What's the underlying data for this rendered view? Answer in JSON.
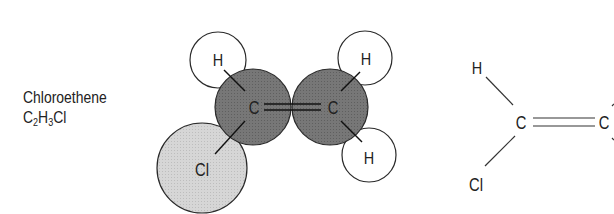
{
  "compound": {
    "name": "Chloroethene",
    "formula_parts": [
      {
        "text": "C",
        "sub": "2"
      },
      {
        "text": "H",
        "sub": "3"
      },
      {
        "text": "Cl",
        "sub": ""
      }
    ]
  },
  "space_filling_model": {
    "atoms": [
      {
        "id": "H1",
        "label": "H",
        "cx": 218,
        "cy": 60,
        "r": 28,
        "fill": "#ffffff"
      },
      {
        "id": "H2",
        "label": "H",
        "cx": 365,
        "cy": 58,
        "r": 27,
        "fill": "#ffffff"
      },
      {
        "id": "H3",
        "label": "H",
        "cx": 369,
        "cy": 155,
        "r": 27,
        "fill": "#ffffff"
      },
      {
        "id": "Cl",
        "label": "Cl",
        "cx": 202,
        "cy": 168,
        "r": 45,
        "fill": "#d4d4d4"
      },
      {
        "id": "C1",
        "label": "C",
        "cx": 253,
        "cy": 107,
        "r": 38,
        "fill": "#7a7a7a"
      },
      {
        "id": "C2",
        "label": "C",
        "cx": 330,
        "cy": 107,
        "r": 38,
        "fill": "#7a7a7a"
      }
    ],
    "bond": "double"
  },
  "structural_formula": {
    "atoms": [
      {
        "id": "sH",
        "label": "H",
        "x": 477,
        "y": 72
      },
      {
        "id": "sC1",
        "label": "C",
        "x": 521,
        "y": 128
      },
      {
        "id": "sCl",
        "label": "Cl",
        "x": 476,
        "y": 191
      },
      {
        "id": "sC2",
        "label": "C",
        "x": 604,
        "y": 128
      }
    ]
  },
  "colors": {
    "carbon": "#7a7a7a",
    "chlorine": "#d4d4d4",
    "hydrogen": "#ffffff",
    "outline": "#2a2a2a"
  }
}
